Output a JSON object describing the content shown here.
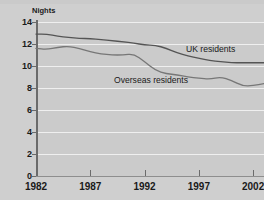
{
  "chart_data": {
    "type": "line",
    "title": "",
    "xlabel": "",
    "ylabel": "Nights",
    "ylim": [
      0,
      14
    ],
    "xlim": [
      1982,
      2003
    ],
    "ytick_labels": [
      "14",
      "12",
      "10",
      "8",
      "6",
      "4",
      "2",
      "0"
    ],
    "ytick_values": [
      14,
      12,
      10,
      8,
      6,
      4,
      2,
      0
    ],
    "xtick_labels": [
      "1982",
      "1987",
      "1992",
      "1997",
      "2002"
    ],
    "xtick_values": [
      1982,
      1987,
      1992,
      1997,
      2002
    ],
    "grid": true,
    "legend_position": "inline-annotation",
    "x": [
      1982,
      1983,
      1984,
      1985,
      1986,
      1987,
      1988,
      1989,
      1990,
      1991,
      1992,
      1993,
      1994,
      1995,
      1996,
      1997,
      1998,
      1999,
      2000,
      2001,
      2002,
      2003
    ],
    "series": [
      {
        "name": "UK residents",
        "color": "#555555",
        "values": [
          12.9,
          12.9,
          12.7,
          12.6,
          12.5,
          12.5,
          12.4,
          12.3,
          12.2,
          12.1,
          11.9,
          11.9,
          11.6,
          11.2,
          10.9,
          10.7,
          10.5,
          10.4,
          10.3,
          10.3,
          10.3,
          10.3
        ]
      },
      {
        "name": "Overseas residents",
        "color": "#777777",
        "values": [
          11.6,
          11.5,
          11.7,
          11.8,
          11.6,
          11.3,
          11.1,
          11.0,
          11.0,
          11.1,
          10.4,
          9.6,
          9.3,
          9.2,
          9.0,
          8.9,
          8.8,
          9.0,
          8.7,
          8.2,
          8.2,
          8.4
        ]
      }
    ]
  },
  "labels": {
    "y_axis_title": "Nights",
    "uk_series_label": "UK residents",
    "overseas_series_label": "Overseas residents"
  },
  "colors": {
    "background": "#cfcfcf",
    "plot_background": "#cbcbcb",
    "gridline": "#efefef",
    "axis": "#6b6b6b",
    "uk_line": "#555555",
    "overseas_line": "#777777",
    "text": "#1a1a1a"
  }
}
